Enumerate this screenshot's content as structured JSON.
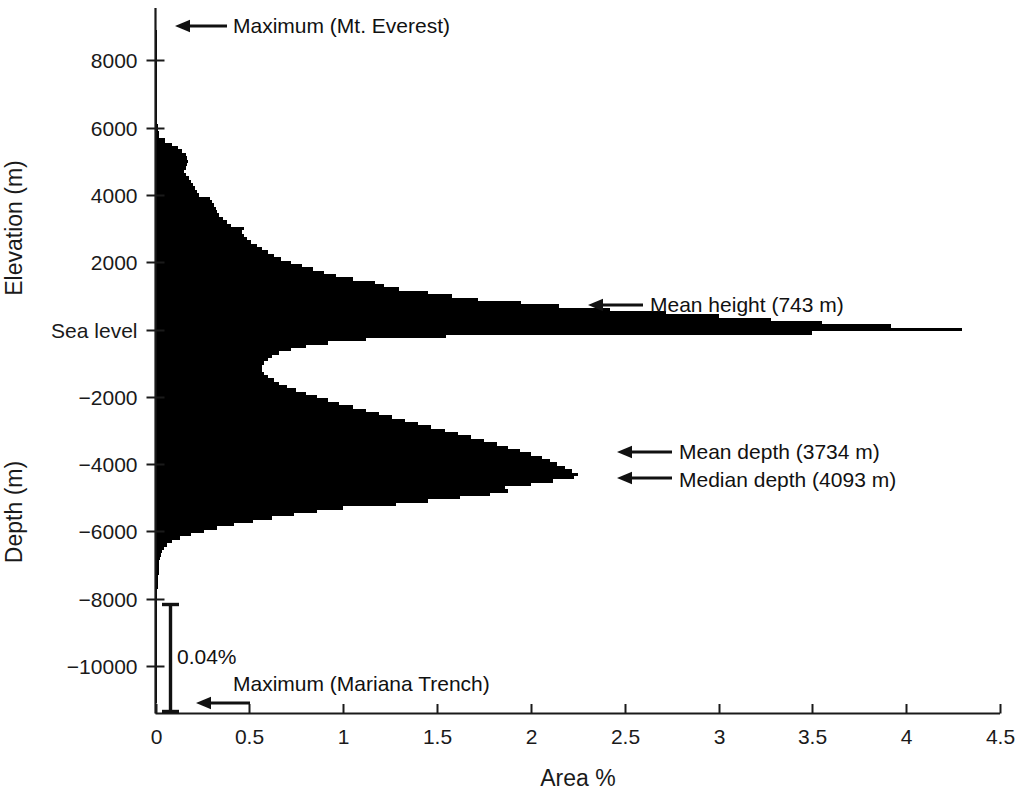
{
  "chart_data": {
    "type": "bar",
    "title": "",
    "orientation": "horizontal",
    "xlabel": "Area %",
    "ylabel_upper": "Elevation  (m)",
    "ylabel_lower": "Depth (m)",
    "xlim": [
      0,
      4.5
    ],
    "ylim": [
      -11250,
      9000
    ],
    "grid": false,
    "legend": null,
    "xticks": [
      0,
      0.5,
      1,
      1.5,
      2,
      2.5,
      3,
      3.5,
      4,
      4.5
    ],
    "xticklabels": [
      "0",
      "0.5",
      "1",
      "1.5",
      "2",
      "2.5",
      "3",
      "3.5",
      "4",
      "4.5"
    ],
    "yticks": [
      8000,
      6000,
      4000,
      2000,
      0,
      -2000,
      -4000,
      -6000,
      -8000,
      -10000
    ],
    "yticklabels": [
      "8000",
      "6000",
      "4000",
      "2000",
      "Sea level",
      "−2000",
      "−4000",
      "−6000",
      "−8000",
      "−10000"
    ],
    "bin_size_m": 100,
    "note": "Hypsographic curve: percent of Earth surface area in each 100 m elevation/depth bin",
    "bins": [
      {
        "elev": 8800,
        "area": 0.002
      },
      {
        "elev": 8600,
        "area": 0.002
      },
      {
        "elev": 8400,
        "area": 0.003
      },
      {
        "elev": 8200,
        "area": 0.003
      },
      {
        "elev": 8000,
        "area": 0.004
      },
      {
        "elev": 7800,
        "area": 0.004
      },
      {
        "elev": 7600,
        "area": 0.005
      },
      {
        "elev": 7400,
        "area": 0.005
      },
      {
        "elev": 7200,
        "area": 0.006
      },
      {
        "elev": 7000,
        "area": 0.006
      },
      {
        "elev": 6800,
        "area": 0.007
      },
      {
        "elev": 6600,
        "area": 0.008
      },
      {
        "elev": 6400,
        "area": 0.009
      },
      {
        "elev": 6200,
        "area": 0.01
      },
      {
        "elev": 6000,
        "area": 0.012
      },
      {
        "elev": 5800,
        "area": 0.02
      },
      {
        "elev": 5600,
        "area": 0.05
      },
      {
        "elev": 5500,
        "area": 0.09
      },
      {
        "elev": 5400,
        "area": 0.12
      },
      {
        "elev": 5300,
        "area": 0.14
      },
      {
        "elev": 5200,
        "area": 0.16
      },
      {
        "elev": 5100,
        "area": 0.17
      },
      {
        "elev": 5000,
        "area": 0.175
      },
      {
        "elev": 4900,
        "area": 0.17
      },
      {
        "elev": 4800,
        "area": 0.16
      },
      {
        "elev": 4700,
        "area": 0.15
      },
      {
        "elev": 4600,
        "area": 0.16
      },
      {
        "elev": 4500,
        "area": 0.18
      },
      {
        "elev": 4400,
        "area": 0.19
      },
      {
        "elev": 4300,
        "area": 0.2
      },
      {
        "elev": 4200,
        "area": 0.21
      },
      {
        "elev": 4100,
        "area": 0.22
      },
      {
        "elev": 4000,
        "area": 0.23
      },
      {
        "elev": 3900,
        "area": 0.29
      },
      {
        "elev": 3800,
        "area": 0.3
      },
      {
        "elev": 3700,
        "area": 0.31
      },
      {
        "elev": 3600,
        "area": 0.32
      },
      {
        "elev": 3500,
        "area": 0.33
      },
      {
        "elev": 3400,
        "area": 0.34
      },
      {
        "elev": 3300,
        "area": 0.36
      },
      {
        "elev": 3200,
        "area": 0.38
      },
      {
        "elev": 3100,
        "area": 0.4
      },
      {
        "elev": 3000,
        "area": 0.47
      },
      {
        "elev": 2900,
        "area": 0.46
      },
      {
        "elev": 2800,
        "area": 0.47
      },
      {
        "elev": 2700,
        "area": 0.49
      },
      {
        "elev": 2600,
        "area": 0.51
      },
      {
        "elev": 2500,
        "area": 0.54
      },
      {
        "elev": 2400,
        "area": 0.57
      },
      {
        "elev": 2300,
        "area": 0.6
      },
      {
        "elev": 2200,
        "area": 0.63
      },
      {
        "elev": 2100,
        "area": 0.67
      },
      {
        "elev": 2000,
        "area": 0.72
      },
      {
        "elev": 1900,
        "area": 0.78
      },
      {
        "elev": 1800,
        "area": 0.84
      },
      {
        "elev": 1700,
        "area": 0.9
      },
      {
        "elev": 1600,
        "area": 0.96
      },
      {
        "elev": 1500,
        "area": 1.05
      },
      {
        "elev": 1400,
        "area": 1.17
      },
      {
        "elev": 1300,
        "area": 1.22
      },
      {
        "elev": 1200,
        "area": 1.3
      },
      {
        "elev": 1100,
        "area": 1.45
      },
      {
        "elev": 1000,
        "area": 1.58
      },
      {
        "elev": 900,
        "area": 1.72
      },
      {
        "elev": 800,
        "area": 1.95
      },
      {
        "elev": 700,
        "area": 2.15
      },
      {
        "elev": 600,
        "area": 2.42
      },
      {
        "elev": 500,
        "area": 2.72
      },
      {
        "elev": 400,
        "area": 3.0
      },
      {
        "elev": 300,
        "area": 3.28
      },
      {
        "elev": 200,
        "area": 3.55
      },
      {
        "elev": 100,
        "area": 3.92
      },
      {
        "elev": 0,
        "area": 4.3
      },
      {
        "elev": -100,
        "area": 3.5
      },
      {
        "elev": -200,
        "area": 1.55
      },
      {
        "elev": -300,
        "area": 1.12
      },
      {
        "elev": -400,
        "area": 0.92
      },
      {
        "elev": -500,
        "area": 0.8
      },
      {
        "elev": -600,
        "area": 0.72
      },
      {
        "elev": -700,
        "area": 0.66
      },
      {
        "elev": -800,
        "area": 0.62
      },
      {
        "elev": -900,
        "area": 0.6
      },
      {
        "elev": -1000,
        "area": 0.58
      },
      {
        "elev": -1100,
        "area": 0.57
      },
      {
        "elev": -1200,
        "area": 0.57
      },
      {
        "elev": -1300,
        "area": 0.58
      },
      {
        "elev": -1400,
        "area": 0.6
      },
      {
        "elev": -1500,
        "area": 0.63
      },
      {
        "elev": -1600,
        "area": 0.66
      },
      {
        "elev": -1700,
        "area": 0.7
      },
      {
        "elev": -1800,
        "area": 0.75
      },
      {
        "elev": -1900,
        "area": 0.8
      },
      {
        "elev": -2000,
        "area": 0.86
      },
      {
        "elev": -2100,
        "area": 0.92
      },
      {
        "elev": -2200,
        "area": 0.98
      },
      {
        "elev": -2300,
        "area": 1.05
      },
      {
        "elev": -2400,
        "area": 1.12
      },
      {
        "elev": -2500,
        "area": 1.19
      },
      {
        "elev": -2600,
        "area": 1.26
      },
      {
        "elev": -2700,
        "area": 1.33
      },
      {
        "elev": -2800,
        "area": 1.4
      },
      {
        "elev": -2900,
        "area": 1.47
      },
      {
        "elev": -3000,
        "area": 1.54
      },
      {
        "elev": -3100,
        "area": 1.61
      },
      {
        "elev": -3200,
        "area": 1.68
      },
      {
        "elev": -3300,
        "area": 1.75
      },
      {
        "elev": -3400,
        "area": 1.82
      },
      {
        "elev": -3500,
        "area": 1.88
      },
      {
        "elev": -3600,
        "area": 1.94
      },
      {
        "elev": -3700,
        "area": 2.0
      },
      {
        "elev": -3800,
        "area": 2.06
      },
      {
        "elev": -3900,
        "area": 2.1
      },
      {
        "elev": -4000,
        "area": 2.14
      },
      {
        "elev": -4100,
        "area": 2.18
      },
      {
        "elev": -4200,
        "area": 2.22
      },
      {
        "elev": -4300,
        "area": 2.25
      },
      {
        "elev": -4400,
        "area": 2.23
      },
      {
        "elev": -4500,
        "area": 2.12
      },
      {
        "elev": -4600,
        "area": 2.0
      },
      {
        "elev": -4700,
        "area": 1.86
      },
      {
        "elev": -4800,
        "area": 1.88
      },
      {
        "elev": -4900,
        "area": 1.78
      },
      {
        "elev": -5000,
        "area": 1.62
      },
      {
        "elev": -5100,
        "area": 1.45
      },
      {
        "elev": -5200,
        "area": 1.28
      },
      {
        "elev": -5300,
        "area": 1.0
      },
      {
        "elev": -5400,
        "area": 0.86
      },
      {
        "elev": -5500,
        "area": 0.74
      },
      {
        "elev": -5600,
        "area": 0.62
      },
      {
        "elev": -5700,
        "area": 0.52
      },
      {
        "elev": -5800,
        "area": 0.42
      },
      {
        "elev": -5900,
        "area": 0.33
      },
      {
        "elev": -6000,
        "area": 0.26
      },
      {
        "elev": -6100,
        "area": 0.19
      },
      {
        "elev": -6200,
        "area": 0.13
      },
      {
        "elev": -6300,
        "area": 0.09
      },
      {
        "elev": -6400,
        "area": 0.06
      },
      {
        "elev": -6500,
        "area": 0.045
      },
      {
        "elev": -6600,
        "area": 0.035
      },
      {
        "elev": -6700,
        "area": 0.028
      },
      {
        "elev": -6800,
        "area": 0.024
      },
      {
        "elev": -6900,
        "area": 0.021
      },
      {
        "elev": -7000,
        "area": 0.019
      },
      {
        "elev": -7200,
        "area": 0.016
      },
      {
        "elev": -7400,
        "area": 0.013
      },
      {
        "elev": -7600,
        "area": 0.011
      },
      {
        "elev": -7800,
        "area": 0.009
      },
      {
        "elev": -8000,
        "area": 0.008
      },
      {
        "elev": -8400,
        "area": 0.006
      },
      {
        "elev": -8800,
        "area": 0.005
      },
      {
        "elev": -9200,
        "area": 0.004
      },
      {
        "elev": -9600,
        "area": 0.003
      },
      {
        "elev": -10000,
        "area": 0.002
      },
      {
        "elev": -10400,
        "area": 0.002
      },
      {
        "elev": -10800,
        "area": 0.001
      },
      {
        "elev": -11000,
        "area": 0.001
      }
    ],
    "annotations": [
      {
        "key": "max_everest",
        "label": "Maximum (Mt. Everest)",
        "elev": 8848,
        "arrow": "left"
      },
      {
        "key": "mean_height",
        "label": "Mean height (743 m)",
        "elev": 743,
        "arrow": "left"
      },
      {
        "key": "mean_depth",
        "label": "Mean depth (3734 m)",
        "elev": -3734,
        "arrow": "left"
      },
      {
        "key": "median_depth",
        "label": "Median depth (4093 m)",
        "elev": -4093,
        "arrow": "left"
      },
      {
        "key": "max_mariana",
        "label": "Maximum (Mariana Trench)",
        "elev": -11034,
        "arrow": "left"
      }
    ],
    "scale_bar": {
      "label": "0.04%",
      "span_percent": 0.04,
      "from_elev": -8000,
      "to_elev": -11250
    },
    "colors": {
      "bar_fill": "#000000",
      "axis": "#1a1a1a",
      "text": "#111111",
      "background": "#ffffff"
    }
  }
}
